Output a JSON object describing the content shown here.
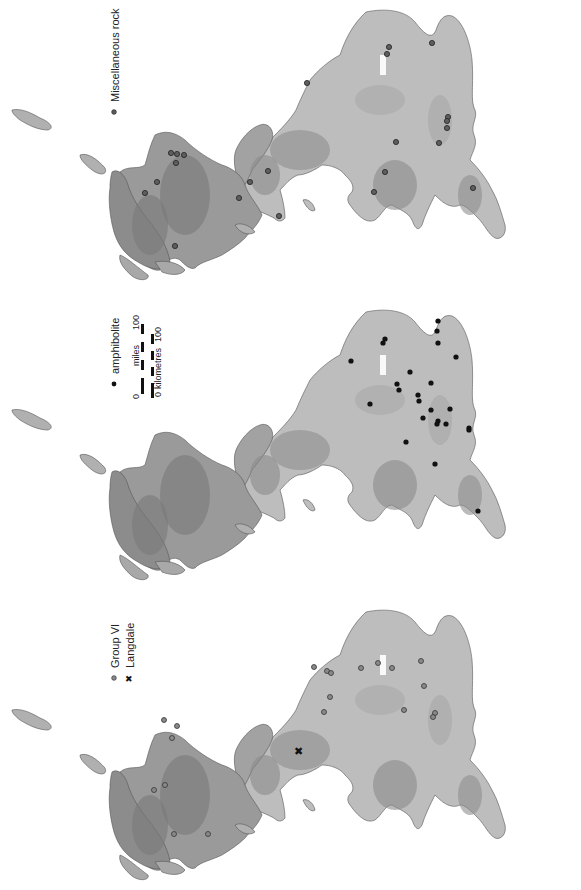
{
  "figure": {
    "orientation": "rotated-90-ccw",
    "colors": {
      "background": "#ffffff",
      "lowland": "#bdbdbd",
      "upland": "#8f8f8f",
      "highland": "#6e6e6e",
      "coast": "#555555",
      "point_dark": "#222222",
      "point_grey": "#6a6a6a"
    }
  },
  "panels": [
    {
      "id": "misc",
      "legend": [
        {
          "symbol": "grey-dot",
          "label": "Miscellaneous rock"
        }
      ],
      "points": [
        [
          389,
          47
        ],
        [
          387,
          54
        ],
        [
          307,
          83
        ],
        [
          432,
          43
        ],
        [
          448,
          117
        ],
        [
          447,
          121
        ],
        [
          447,
          128
        ],
        [
          396,
          142
        ],
        [
          439,
          143
        ],
        [
          385,
          172
        ],
        [
          374,
          192
        ],
        [
          473,
          188
        ],
        [
          268,
          171
        ],
        [
          250,
          182
        ],
        [
          239,
          198
        ],
        [
          279,
          216
        ],
        [
          171,
          153
        ],
        [
          177,
          154
        ],
        [
          184,
          155
        ],
        [
          176,
          163
        ],
        [
          157,
          182
        ],
        [
          145,
          193
        ],
        [
          175,
          246
        ]
      ]
    },
    {
      "id": "amphibolite",
      "legend": [
        {
          "symbol": "black-dot",
          "label": "amphibolite"
        }
      ],
      "scale_bar": {
        "miles_label": "miles",
        "miles_start": "0",
        "miles_end": "100",
        "km_label": "kilometres",
        "km_start": "0",
        "km_end": "100"
      },
      "points": [
        [
          351,
          361
        ],
        [
          385,
          339
        ],
        [
          383,
          343
        ],
        [
          438,
          321
        ],
        [
          437,
          331
        ],
        [
          438,
          343
        ],
        [
          456,
          357
        ],
        [
          410,
          372
        ],
        [
          431,
          383
        ],
        [
          397,
          384
        ],
        [
          399,
          390
        ],
        [
          370,
          404
        ],
        [
          418,
          395
        ],
        [
          419,
          401
        ],
        [
          431,
          410
        ],
        [
          450,
          409
        ],
        [
          423,
          418
        ],
        [
          438,
          421
        ],
        [
          437,
          424
        ],
        [
          446,
          424
        ],
        [
          469,
          428
        ],
        [
          469,
          430
        ],
        [
          406,
          442
        ],
        [
          435,
          464
        ],
        [
          478,
          511
        ]
      ]
    },
    {
      "id": "group-vi",
      "legend": [
        {
          "symbol": "grey-dot",
          "label": "Group VI"
        },
        {
          "symbol": "cross",
          "label": "Langdale"
        }
      ],
      "points": [
        [
          314,
          667
        ],
        [
          327,
          671
        ],
        [
          331,
          673
        ],
        [
          361,
          668
        ],
        [
          378,
          663
        ],
        [
          392,
          668
        ],
        [
          421,
          661
        ],
        [
          424,
          686
        ],
        [
          330,
          697
        ],
        [
          324,
          712
        ],
        [
          404,
          710
        ],
        [
          435,
          713
        ],
        [
          433,
          717
        ],
        [
          164,
          720
        ],
        [
          177,
          726
        ],
        [
          172,
          738
        ],
        [
          165,
          785
        ],
        [
          154,
          790
        ],
        [
          174,
          834
        ],
        [
          208,
          834
        ]
      ],
      "special_points": [
        {
          "label": "Langdale",
          "x": 298,
          "y": 751
        }
      ]
    }
  ]
}
